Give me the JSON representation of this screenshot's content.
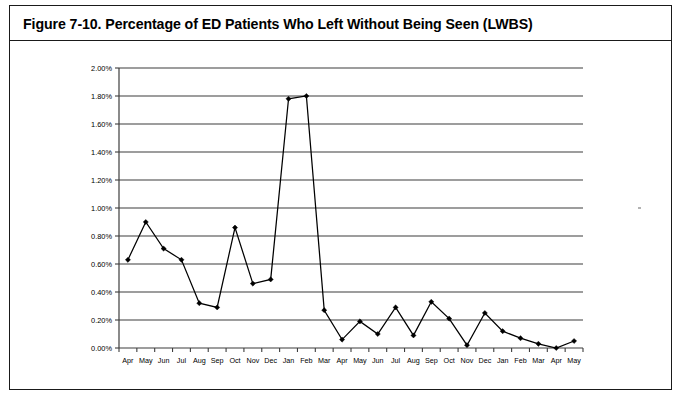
{
  "figure": {
    "title": "Figure 7-10. Percentage of ED Patients Who Left Without Being Seen (LWBS)"
  },
  "chart_data": {
    "type": "line",
    "title": "Figure 7-10. Percentage of ED Patients Who Left Without Being Seen (LWBS)",
    "xlabel": "",
    "ylabel": "",
    "ylim": [
      0.0,
      2.0
    ],
    "ytick_values": [
      0.0,
      0.2,
      0.4,
      0.6,
      0.8,
      1.0,
      1.2,
      1.4,
      1.6,
      1.8,
      2.0
    ],
    "ytick_labels": [
      "0.00%",
      "0.20%",
      "0.40%",
      "0.60%",
      "0.80%",
      "1.00%",
      "1.20%",
      "1.40%",
      "1.60%",
      "1.80%",
      "2.00%"
    ],
    "grid": true,
    "legend": false,
    "marker": "diamond",
    "categories": [
      "Apr",
      "May",
      "Jun",
      "Jul",
      "Aug",
      "Sep",
      "Oct",
      "Nov",
      "Dec",
      "Jan",
      "Feb",
      "Mar",
      "Apr",
      "May",
      "Jun",
      "Jul",
      "Aug",
      "Sep",
      "Oct",
      "Nov",
      "Dec",
      "Jan",
      "Feb",
      "Mar",
      "Apr",
      "May"
    ],
    "values": [
      0.63,
      0.9,
      0.71,
      0.63,
      0.32,
      0.29,
      0.86,
      0.46,
      0.49,
      1.78,
      1.8,
      0.27,
      0.06,
      0.19,
      0.1,
      0.29,
      0.09,
      0.33,
      0.21,
      0.02,
      0.25,
      0.12,
      0.07,
      0.03,
      0.0,
      0.05
    ],
    "value_labels": [
      "0.63%",
      "0.90%",
      "0.71%",
      "0.63%",
      "0.32%",
      "0.29%",
      "0.86%",
      "0.46%",
      "0.49%",
      "1.78%",
      "1.80%",
      "0.27%",
      "0.06%",
      "0.19%",
      "0.10%",
      "0.29%",
      "0.09%",
      "0.33%",
      "0.21%",
      "0.02%",
      "0.25%",
      "0.12%",
      "0.07%",
      "0.03%",
      "0.00%",
      "0.05%"
    ],
    "colors": {
      "series": "#000000",
      "grid": "#3d3d3d",
      "axis": "#3d3d3d",
      "background": "#ffffff",
      "border": "#1a1a1a"
    }
  }
}
